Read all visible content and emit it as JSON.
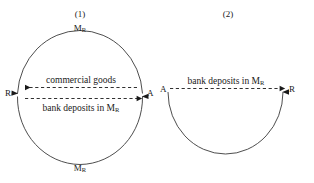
{
  "figure": {
    "background_color": "#ffffff",
    "stroke_color": "#3a3a3a",
    "text_color": "#1a1a1a",
    "panels": [
      {
        "id": "panel-1",
        "heading": "(1)",
        "shape": "full-circle",
        "top_money_label": {
          "base": "M",
          "subscript": "R"
        },
        "bottom_money_label": {
          "base": "M",
          "subscript": "R"
        },
        "left_node": "R",
        "right_node": "A",
        "flows": [
          {
            "id": "commercial-goods",
            "label_base": "commercial goods",
            "label_subscript": "",
            "direction": "left",
            "style": "dashed",
            "position": "above"
          },
          {
            "id": "bank-deposits-1",
            "label_base": "bank deposits in M",
            "label_subscript": "R",
            "direction": "right",
            "style": "dashed",
            "position": "below"
          }
        ],
        "arc_arrowheads": [
          "left-up",
          "right-up"
        ]
      },
      {
        "id": "panel-2",
        "heading": "(2)",
        "shape": "lower-semicircle",
        "top_money_label": null,
        "bottom_money_label": null,
        "left_node": "A",
        "right_node": "R",
        "flows": [
          {
            "id": "bank-deposits-2",
            "label_base": "bank deposits in M",
            "label_subscript": "R",
            "direction": "right",
            "style": "dashed",
            "position": "above"
          }
        ],
        "arc_arrowheads": [
          "right-up"
        ]
      }
    ]
  }
}
